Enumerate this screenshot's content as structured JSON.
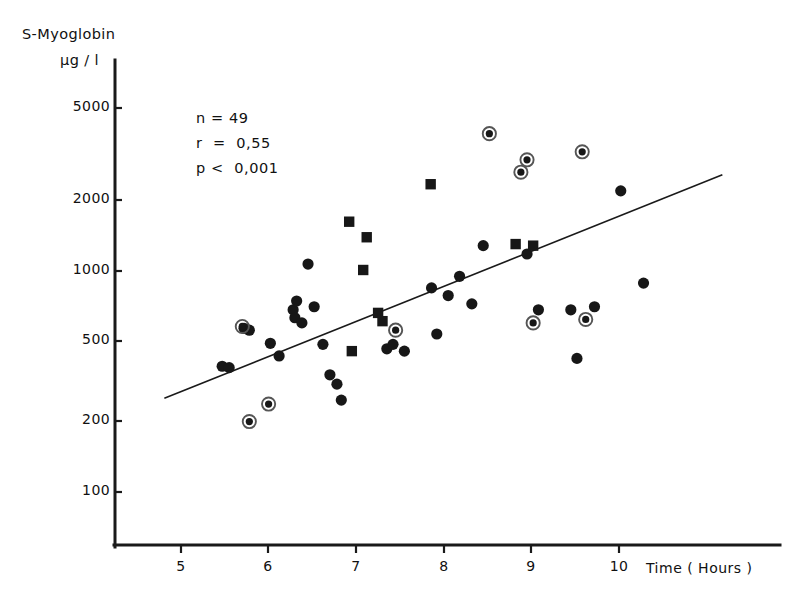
{
  "chart_data": {
    "type": "scatter",
    "title": "",
    "ylabel_line1": "S-Myoglobin",
    "ylabel_line2": "µg / l",
    "xlabel": "Time ( Hours )",
    "yscale": "log",
    "xlim": [
      4.45,
      10.9
    ],
    "ylim": [
      75,
      7000
    ],
    "grid": false,
    "legend_position": "none",
    "yticks": [
      5000,
      2000,
      1000,
      500,
      200,
      100
    ],
    "ytick_labels": [
      "5000",
      "2000",
      "1000",
      "500",
      "200",
      "100"
    ],
    "xticks": [
      5,
      6,
      7,
      8,
      9,
      10
    ],
    "xtick_labels": [
      "5",
      "6",
      "7",
      "8",
      "9",
      "10"
    ],
    "annotations": {
      "n_label": "n = 49",
      "r_label": "r  =  0,55",
      "p_label": "p <  0,001",
      "n_value": 49,
      "r_value": 0.55,
      "p_value": "< 0,001"
    },
    "regression_line": {
      "x_start": 4.81,
      "y_start": 260,
      "x_end": 11.18,
      "y_end": 2530
    },
    "series": [
      {
        "name": "circle",
        "marker": "filled-circle",
        "points": [
          [
            5.47,
            360
          ],
          [
            5.55,
            355
          ],
          [
            5.72,
            530
          ],
          [
            5.78,
            520
          ],
          [
            6.02,
            455
          ],
          [
            6.12,
            400
          ],
          [
            6.28,
            640
          ],
          [
            6.3,
            590
          ],
          [
            6.32,
            700
          ],
          [
            6.38,
            560
          ],
          [
            6.45,
            1020
          ],
          [
            6.52,
            660
          ],
          [
            6.62,
            450
          ],
          [
            6.7,
            330
          ],
          [
            6.78,
            300
          ],
          [
            6.83,
            255
          ],
          [
            7.35,
            430
          ],
          [
            7.42,
            450
          ],
          [
            7.55,
            420
          ],
          [
            7.86,
            800
          ],
          [
            7.92,
            500
          ],
          [
            8.05,
            740
          ],
          [
            8.18,
            900
          ],
          [
            8.32,
            680
          ],
          [
            8.45,
            1230
          ],
          [
            8.95,
            1130
          ],
          [
            9.08,
            640
          ],
          [
            9.45,
            640
          ],
          [
            9.52,
            390
          ],
          [
            9.72,
            660
          ],
          [
            10.02,
            2150
          ],
          [
            10.28,
            840
          ]
        ]
      },
      {
        "name": "square",
        "marker": "filled-square",
        "points": [
          [
            6.92,
            1570
          ],
          [
            7.08,
            960
          ],
          [
            7.12,
            1340
          ],
          [
            7.25,
            620
          ],
          [
            7.3,
            570
          ],
          [
            6.95,
            420
          ],
          [
            7.85,
            2300
          ],
          [
            8.82,
            1250
          ],
          [
            9.02,
            1230
          ]
        ]
      },
      {
        "name": "ringed-circle",
        "marker": "circle-with-ring",
        "points": [
          [
            5.7,
            540
          ],
          [
            5.78,
            205
          ],
          [
            6.0,
            245
          ],
          [
            7.45,
            520
          ],
          [
            8.52,
            3850
          ],
          [
            8.88,
            2600
          ],
          [
            8.95,
            2950
          ],
          [
            9.02,
            560
          ],
          [
            9.58,
            3200
          ],
          [
            9.62,
            580
          ]
        ]
      }
    ]
  },
  "axes_pixels": {
    "x_axis_y": 545,
    "y_axis_x": 115,
    "x_tick_x": [
      181,
      268,
      356,
      444,
      531,
      619
    ],
    "y_tick_y": [
      108,
      200,
      271,
      341,
      421,
      492
    ],
    "plot_left": 115,
    "plot_right": 780,
    "plot_top": 60,
    "plot_bottom": 545
  },
  "colors": {
    "ink": "#1a1a1a",
    "marker": "#171717",
    "ring": "#555555",
    "background": "#ffffff"
  }
}
